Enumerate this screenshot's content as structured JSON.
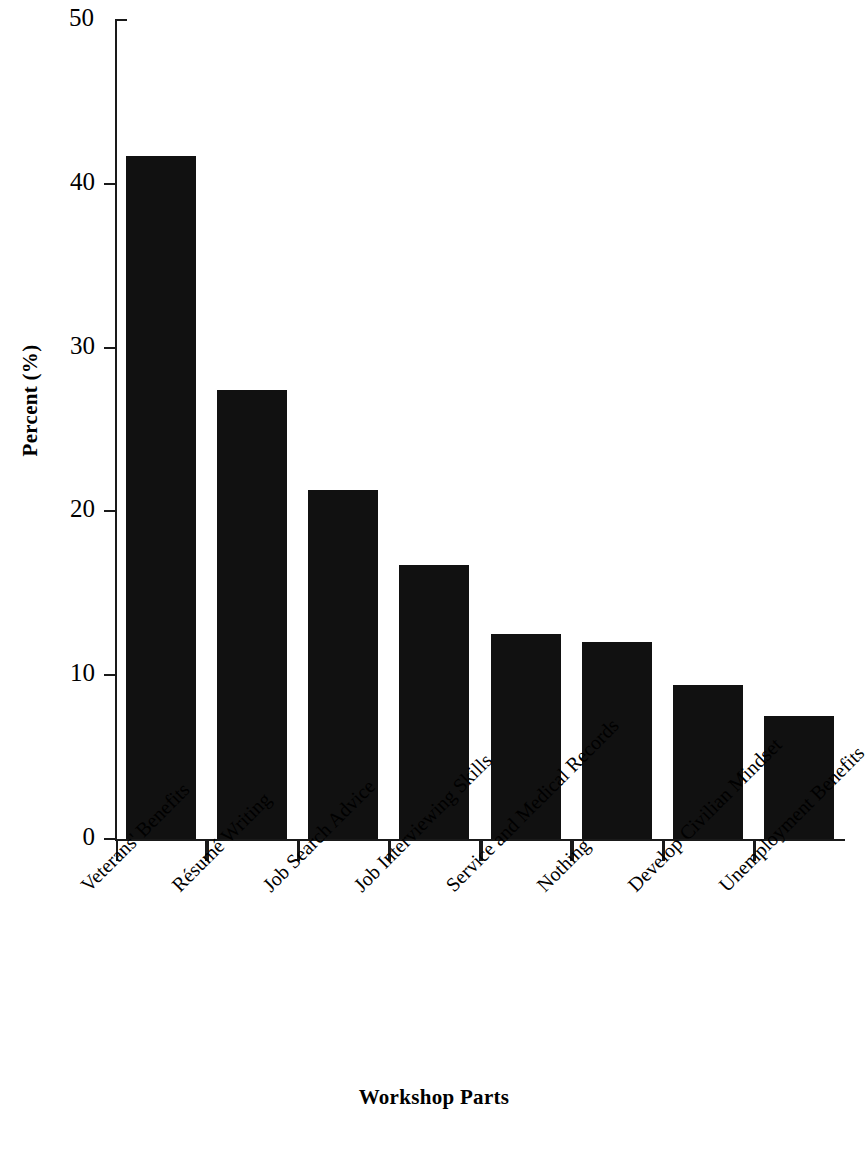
{
  "chart_data": {
    "type": "bar",
    "title": "",
    "subtitle": "",
    "xlabel": "Workshop Parts",
    "ylabel": "Percent (%)",
    "ylim": [
      0,
      50
    ],
    "ytick_labels": [
      "50",
      "40",
      "30",
      "20",
      "10",
      "0"
    ],
    "yticks": [
      50,
      40,
      30,
      20,
      10,
      0
    ],
    "grid": false,
    "legend": null,
    "legend_position": "none",
    "bar_color": "#111111",
    "categories": [
      "Veterans' Benefits",
      "Résumé Writing",
      "Job Search Advice",
      "Job Interviewing Skills",
      "Service and Medical Records",
      "Nothing",
      "Develop Civilian Mindset",
      "Unemployment Benefits"
    ],
    "values": [
      41.7,
      27.4,
      21.3,
      16.7,
      12.5,
      12.0,
      9.4,
      7.5
    ]
  },
  "axes": {
    "y_title": "Percent (%)",
    "x_title": "Workshop Parts"
  }
}
